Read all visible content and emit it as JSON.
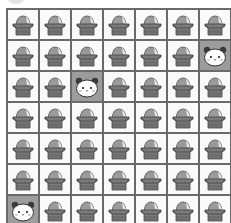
{
  "game": {
    "type": "grid-tile-puzzle",
    "rows": 7,
    "cols": 7,
    "colors": {
      "grid_line": "#6a6a6a",
      "cell_bg": "#fafafa",
      "panda_cell_bg": "#9c9c9c",
      "box_body": "#7a7a7a",
      "box_dome": "#9a9a9a"
    },
    "icons": {
      "box": "covered-box-icon",
      "panda": "panda-face-icon"
    },
    "grid": [
      [
        "box",
        "box",
        "box",
        "box",
        "box",
        "box",
        "box"
      ],
      [
        "box",
        "box",
        "box",
        "box",
        "box",
        "box",
        "panda"
      ],
      [
        "box",
        "box",
        "panda",
        "box",
        "box",
        "box",
        "box"
      ],
      [
        "box",
        "box",
        "box",
        "box",
        "box",
        "box",
        "box"
      ],
      [
        "box",
        "box",
        "box",
        "box",
        "box",
        "box",
        "box"
      ],
      [
        "box",
        "box",
        "box",
        "box",
        "box",
        "box",
        "box"
      ],
      [
        "panda",
        "box",
        "box",
        "box",
        "box",
        "box",
        "box"
      ]
    ]
  }
}
